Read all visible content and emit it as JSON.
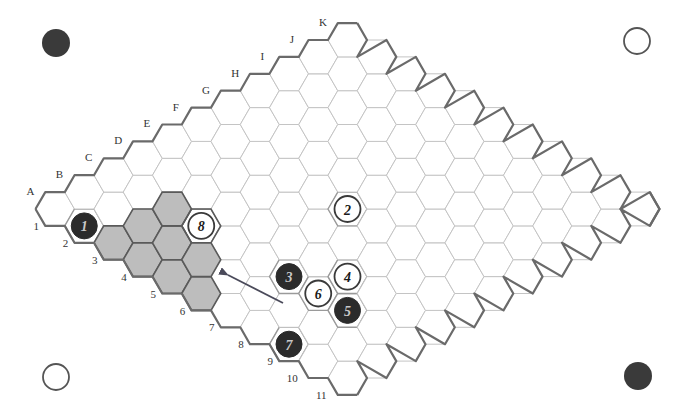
{
  "game": "Hex",
  "board": {
    "size": 11,
    "columns": [
      "A",
      "B",
      "C",
      "D",
      "E",
      "F",
      "G",
      "H",
      "I",
      "J",
      "K"
    ],
    "rows": [
      "1",
      "2",
      "3",
      "4",
      "5",
      "6",
      "7",
      "8",
      "9",
      "10",
      "11"
    ],
    "origin": {
      "x": 55,
      "y": 209
    },
    "step": {
      "dx": 29.25,
      "dy": 16.9
    },
    "hex_radius": 19.5
  },
  "colors": {
    "black_stone": "#2b2b2b",
    "black_stone_text": "#c8c8c8",
    "white_stone": "#ffffff",
    "white_stone_ring": "#3a3a3a",
    "white_stone_text": "#1a1a1a",
    "shaded_cell": "#bdbdbd",
    "grid_line": "#c4c4c4",
    "edge_line": "#6a6a6a",
    "arrow": "#4a4a5a"
  },
  "moves": [
    {
      "number": "1",
      "cell": "A2",
      "color": "black"
    },
    {
      "number": "2",
      "cell": "F6",
      "color": "white"
    },
    {
      "number": "3",
      "cell": "C7",
      "color": "black"
    },
    {
      "number": "4",
      "cell": "D8",
      "color": "white"
    },
    {
      "number": "5",
      "cell": "C9",
      "color": "black"
    },
    {
      "number": "6",
      "cell": "C8",
      "color": "white"
    },
    {
      "number": "7",
      "cell": "A9",
      "color": "black"
    },
    {
      "number": "8",
      "cell": "C4",
      "color": "white"
    }
  ],
  "shaded_cells": [
    "A3",
    "B3",
    "C3",
    "A4",
    "B4",
    "A5",
    "B5",
    "A6"
  ],
  "highlight_outline_cells": [
    "C4"
  ],
  "arrow": {
    "from": {
      "x": 283,
      "y": 303
    },
    "to": {
      "x": 228,
      "y": 275
    }
  },
  "corner_markers": [
    {
      "position": "top-left",
      "x": 56,
      "y": 43,
      "color": "black"
    },
    {
      "position": "top-right",
      "x": 637,
      "y": 41,
      "color": "white"
    },
    {
      "position": "bottom-left",
      "x": 56,
      "y": 377,
      "color": "white"
    },
    {
      "position": "bottom-right",
      "x": 638,
      "y": 376,
      "color": "black"
    }
  ]
}
